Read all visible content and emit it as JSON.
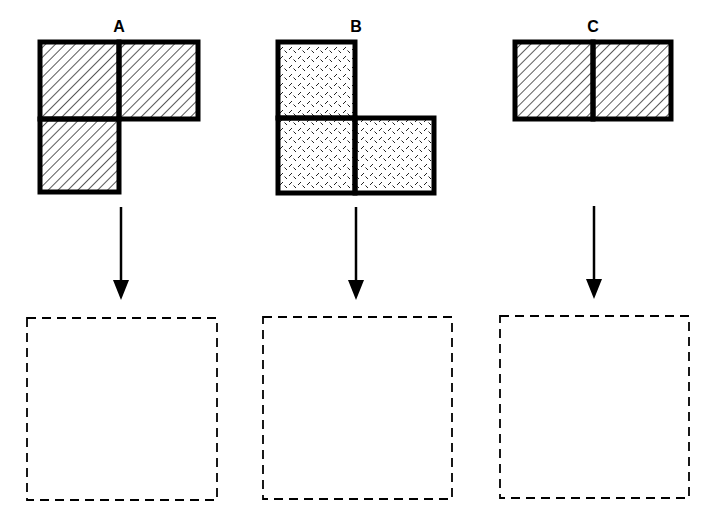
{
  "figures": [
    {
      "label": "A",
      "pattern": "diagonal-hatch",
      "shape": "L-tromino (top-left, top-right, bottom-left)",
      "cells": [
        [
          0,
          0
        ],
        [
          1,
          0
        ],
        [
          0,
          1
        ]
      ]
    },
    {
      "label": "B",
      "pattern": "dotted-dash",
      "shape": "L-tromino (top-left, bottom-left, bottom-right)",
      "cells": [
        [
          0,
          0
        ],
        [
          0,
          1
        ],
        [
          1,
          1
        ]
      ]
    },
    {
      "label": "C",
      "pattern": "diagonal-hatch",
      "shape": "domino (horizontal)",
      "cells": [
        [
          0,
          0
        ],
        [
          1,
          0
        ]
      ]
    }
  ],
  "answer_boxes": [
    {
      "for": "A",
      "content": ""
    },
    {
      "for": "B",
      "content": ""
    },
    {
      "for": "C",
      "content": ""
    }
  ],
  "colors": {
    "stroke": "#000000",
    "background": "#ffffff"
  }
}
